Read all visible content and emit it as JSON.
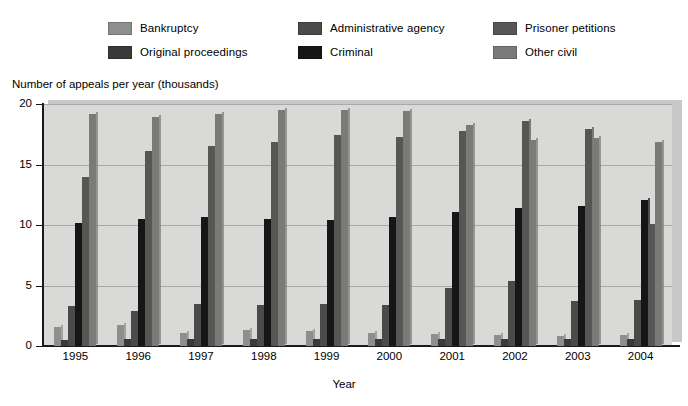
{
  "legend": {
    "items": [
      {
        "label": "Bankruptcy",
        "color": "#8e8e8c"
      },
      {
        "label": "Administrative agency",
        "color": "#4a4a48"
      },
      {
        "label": "Prisoner petitions",
        "color": "#565654"
      },
      {
        "label": "Original proceedings",
        "color": "#3a3a38"
      },
      {
        "label": "Criminal",
        "color": "#161616"
      },
      {
        "label": "Other civil",
        "color": "#7a7a78"
      }
    ]
  },
  "axis": {
    "y_title": "Number of appeals per year (thousands)",
    "x_title": "Year",
    "y_ticks": [
      "0",
      "5",
      "10",
      "15",
      "20"
    ]
  },
  "chart_data": {
    "type": "bar",
    "title": "",
    "xlabel": "Year",
    "ylabel": "Number of appeals per year (thousands)",
    "ylim": [
      0,
      20
    ],
    "yticks": [
      0,
      5,
      10,
      15,
      20
    ],
    "grid": true,
    "legend_position": "top",
    "categories": [
      "1995",
      "1996",
      "1997",
      "1998",
      "1999",
      "2000",
      "2001",
      "2002",
      "2003",
      "2004"
    ],
    "series": [
      {
        "name": "Bankruptcy",
        "color": "#8e8e8c",
        "values": [
          1.6,
          1.7,
          1.1,
          1.3,
          1.2,
          1.1,
          1.0,
          0.9,
          0.8,
          0.9
        ]
      },
      {
        "name": "Original proceedings",
        "color": "#3a3a38",
        "values": [
          0.5,
          0.6,
          0.6,
          0.6,
          0.6,
          0.6,
          0.6,
          0.6,
          0.6,
          0.6
        ]
      },
      {
        "name": "Administrative agency",
        "color": "#4a4a48",
        "values": [
          3.3,
          2.9,
          3.5,
          3.4,
          3.5,
          3.4,
          4.8,
          5.4,
          3.7,
          3.8
        ]
      },
      {
        "name": "Criminal",
        "color": "#161616",
        "values": [
          10.2,
          10.5,
          10.7,
          10.5,
          10.4,
          10.7,
          11.1,
          11.4,
          11.6,
          12.1
        ]
      },
      {
        "name": "Prisoner petitions",
        "color": "#565654",
        "values": [
          14.0,
          16.1,
          16.5,
          16.9,
          17.4,
          17.3,
          17.8,
          18.6,
          17.9,
          10.1
        ]
      },
      {
        "name": "Other civil",
        "color": "#7a7a78",
        "values": [
          19.2,
          18.9,
          19.2,
          19.5,
          19.5,
          19.4,
          18.3,
          17.0,
          17.2,
          16.9
        ]
      }
    ]
  }
}
